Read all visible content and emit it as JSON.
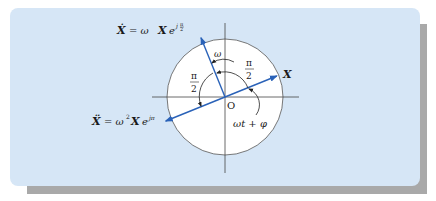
{
  "diagram": {
    "origin_label": "O",
    "vectors": [
      {
        "id": "displacement",
        "label_main": "X",
        "angle_deg": 22,
        "color": "#2a62b8"
      },
      {
        "id": "velocity",
        "label_main": "Ẋ",
        "equation_rhs": "= ωXe",
        "exponent": "j π/2",
        "angle_deg": 112,
        "color": "#2a62b8"
      },
      {
        "id": "acceleration",
        "label_main": "Ẍ",
        "equation_rhs": "= ω²Xe",
        "exponent": "jπ",
        "angle_deg": 202,
        "color": "#2a62b8"
      }
    ],
    "labels": {
      "x_label": "X",
      "xdot_lhs": "Ẋ",
      "xdot_eq": "= ω",
      "xdot_X": "X",
      "xdot_e": "e",
      "xdot_exp_j": "j",
      "xdot_exp_num": "π",
      "xdot_exp_den": "2",
      "xddot_lhs": "Ẍ",
      "xddot_eq": "= ω",
      "xddot_sq": "2",
      "xddot_X": "X",
      "xddot_e": "e",
      "xddot_exp": "jπ",
      "omega": "ω",
      "half_pi_right_num": "π",
      "half_pi_right_den": "2",
      "half_pi_left_num": "π",
      "half_pi_left_den": "2",
      "phase": "ωt + φ",
      "origin": "O"
    },
    "colors": {
      "panel": "#d6e6f6",
      "shadow": "#a9a9a9",
      "circle_fill": "#ffffff",
      "vector": "#2a62b8",
      "axis": "#333333"
    }
  }
}
